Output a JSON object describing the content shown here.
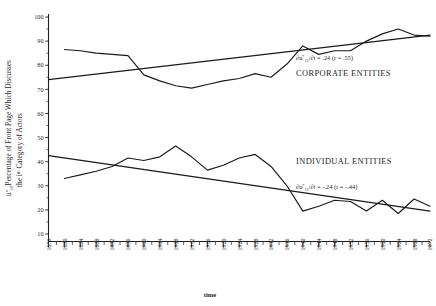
{
  "figure": {
    "background_color": "#ffffff",
    "ink_color": "#1a1a1a"
  },
  "axes": {
    "y_label_line1": "Percentage of Front Page Which Discusses",
    "y_label_line2": "the i",
    "y_label_line2_sup": "th",
    "y_label_line2_rest": " Category of Actors",
    "y_label_symbol": "u",
    "y_label_symbol_sup": "*",
    "y_label_symbol_sub": "it",
    "y_label_symbol_punct": ",",
    "x_title": "time"
  },
  "annotations": {
    "corporate": {
      "series_name": "CORPORATE ENTITIES",
      "eq_prefix": "∂u",
      "eq_sup": "*",
      "eq_sub": "11",
      "eq_mid": "/∂t = .24 (r = .55)",
      "slope": ".24",
      "correlation": ".55"
    },
    "individual": {
      "series_name": "INDIVIDUAL ENTITIES",
      "eq_prefix": "∂u",
      "eq_sup": "*",
      "eq_sub": "11",
      "eq_mid": "/∂t = -.24 (r = -.44)",
      "slope": "-.24",
      "correlation": "-.44"
    }
  },
  "chart_data": {
    "type": "line",
    "title": "",
    "xlabel": "time",
    "ylabel": "u*it, Percentage of Front Page Which Discusses the ith Category of Actors",
    "xlim": [
      1876,
      1972
    ],
    "ylim": [
      0,
      100
    ],
    "grid": false,
    "legend_position": "inline-annotation",
    "y_ticks": [
      10,
      20,
      30,
      40,
      50,
      60,
      70,
      80,
      90,
      100
    ],
    "x_ticks": [
      1876,
      1880,
      1884,
      1888,
      1892,
      1896,
      1900,
      1904,
      1908,
      1912,
      1916,
      1920,
      1924,
      1928,
      1932,
      1936,
      1940,
      1944,
      1948,
      1952,
      1956,
      1960,
      1964,
      1968,
      1972
    ],
    "x_minor_interval": 2,
    "series": [
      {
        "name": "CORPORATE ENTITIES",
        "x": [
          1880,
          1884,
          1888,
          1892,
          1896,
          1900,
          1904,
          1908,
          1912,
          1916,
          1920,
          1924,
          1928,
          1932,
          1936,
          1940,
          1944,
          1948,
          1952,
          1956,
          1960,
          1964,
          1968,
          1972
        ],
        "values": [
          86.5,
          86.0,
          85.0,
          84.5,
          84.0,
          76.0,
          73.5,
          71.5,
          70.5,
          72.0,
          73.5,
          74.5,
          76.5,
          75.0,
          80.5,
          88.0,
          84.5,
          86.0,
          86.0,
          90.0,
          93.0,
          95.0,
          92.5,
          92.0
        ],
        "trend": {
          "x": [
            1876,
            1972
          ],
          "values": [
            74.0,
            92.5
          ],
          "slope": 0.24,
          "r": 0.55
        }
      },
      {
        "name": "INDIVIDUAL ENTITIES",
        "x": [
          1880,
          1884,
          1888,
          1892,
          1896,
          1900,
          1904,
          1908,
          1912,
          1916,
          1920,
          1924,
          1928,
          1932,
          1936,
          1940,
          1944,
          1948,
          1952,
          1956,
          1960,
          1964,
          1968,
          1972
        ],
        "values": [
          33.0,
          34.5,
          36.0,
          38.0,
          41.5,
          40.5,
          42.0,
          46.5,
          42.0,
          36.5,
          38.5,
          41.5,
          43.0,
          38.0,
          30.0,
          19.5,
          21.5,
          24.0,
          23.5,
          19.5,
          24.0,
          18.5,
          24.5,
          21.5
        ],
        "trend": {
          "x": [
            1876,
            1972
          ],
          "values": [
            42.5,
            19.5
          ],
          "slope": -0.24,
          "r": -0.44
        }
      }
    ]
  }
}
